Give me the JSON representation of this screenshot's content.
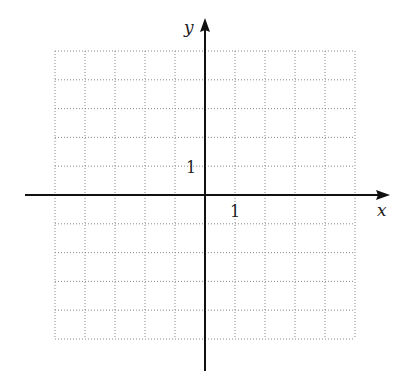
{
  "chart_data": {
    "type": "coordinate-grid",
    "title": "",
    "xlabel": "x",
    "ylabel": "y",
    "grid": true,
    "grid_style": "dotted",
    "xlim": [
      -5,
      5
    ],
    "ylim": [
      -5,
      5
    ],
    "tick_labels": {
      "x": [
        {
          "value": 1,
          "label": "1"
        }
      ],
      "y": [
        {
          "value": 1,
          "label": "1"
        }
      ]
    },
    "series": []
  },
  "axes": {
    "x_label": "x",
    "y_label": "y",
    "x_tick_label": "1",
    "y_tick_label": "1"
  },
  "colors": {
    "axis": "#111111",
    "grid": "#8a8a8a",
    "background": "#ffffff"
  }
}
